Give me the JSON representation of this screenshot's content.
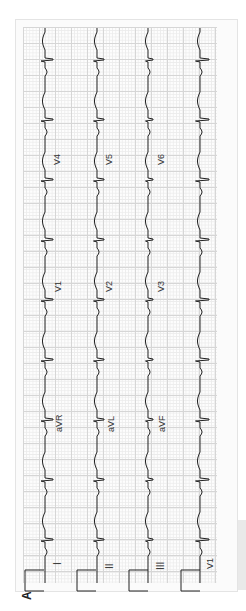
{
  "figure": {
    "panel_label": "A",
    "orientation": "rotated 90 degrees counter-clockwise",
    "colors": {
      "trace": "#222222",
      "grid_major": "#d6d6d6",
      "grid_minor": "#ececec",
      "paper": "#fbfbfb"
    }
  },
  "rows": [
    {
      "leads": [
        "I",
        "aVR",
        "V1",
        "V4"
      ]
    },
    {
      "leads": [
        "II",
        "aVL",
        "V2",
        "V5"
      ]
    },
    {
      "leads": [
        "III",
        "aVF",
        "V3",
        "V6"
      ]
    },
    {
      "leads": [
        "V1"
      ],
      "rhythm_strip": true
    }
  ],
  "labels": {
    "r0_l0": "I",
    "r0_l1": "aVR",
    "r0_l2": "V1",
    "r0_l3": "V4",
    "r1_l0": "II",
    "r1_l1": "aVL",
    "r1_l2": "V2",
    "r1_l3": "V5",
    "r2_l0": "III",
    "r2_l1": "aVF",
    "r2_l2": "V3",
    "r2_l3": "V6",
    "r3_l0": "V1"
  }
}
